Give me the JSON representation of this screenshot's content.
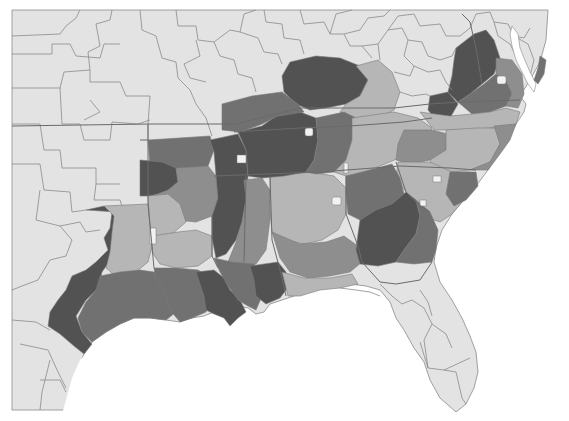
{
  "map": {
    "type": "choropleth",
    "region": "Southeastern United States",
    "projection_hint": "Albers-like, conterminous US south-east portion",
    "has_title": false,
    "has_legend": false,
    "has_labels": false,
    "colors": {
      "page_background": "#ffffff",
      "water": "#ffffff",
      "land_no_data": "#e3e3e3",
      "boundary_line": "#8a8a8a",
      "class_1_lightest": "#b6b6b6",
      "class_2_medium": "#8e8e8e",
      "class_3_medium_dark": "#717171",
      "class_4_darkest": "#525252",
      "holes_light": "#f2f2f2"
    },
    "classes": [
      {
        "id": 1,
        "shade": "lightest",
        "color": "#b6b6b6"
      },
      {
        "id": 2,
        "shade": "medium",
        "color": "#8e8e8e"
      },
      {
        "id": 3,
        "shade": "medium-dark",
        "color": "#717171"
      },
      {
        "id": 4,
        "shade": "darkest",
        "color": "#525252"
      }
    ],
    "shaded_regions": [
      {
        "name": "east-texas",
        "class": 4
      },
      {
        "name": "east-texas-interior",
        "class": 1
      },
      {
        "name": "texas-gulf-coast",
        "class": 3
      },
      {
        "name": "arkansas-north",
        "class": 3
      },
      {
        "name": "arkansas-west",
        "class": 4
      },
      {
        "name": "arkansas-delta",
        "class": 2
      },
      {
        "name": "louisiana-north",
        "class": 1
      },
      {
        "name": "louisiana-south",
        "class": 3
      },
      {
        "name": "louisiana-delta",
        "class": 4
      },
      {
        "name": "mississippi-delta",
        "class": 4
      },
      {
        "name": "mississippi-east",
        "class": 2
      },
      {
        "name": "mississippi-gulf",
        "class": 4
      },
      {
        "name": "west-tennessee",
        "class": 4
      },
      {
        "name": "kentucky-west",
        "class": 4
      },
      {
        "name": "kentucky-north-central",
        "class": 4
      },
      {
        "name": "kentucky-east",
        "class": 1
      },
      {
        "name": "middle-tennessee",
        "class": 3
      },
      {
        "name": "east-tennessee",
        "class": 1
      },
      {
        "name": "alabama-north",
        "class": 1
      },
      {
        "name": "alabama-central",
        "class": 2
      },
      {
        "name": "alabama-south",
        "class": 1
      },
      {
        "name": "georgia-central",
        "class": 4
      },
      {
        "name": "georgia-north",
        "class": 3
      },
      {
        "name": "georgia-east",
        "class": 3
      },
      {
        "name": "south-carolina",
        "class": 1
      },
      {
        "name": "south-carolina-coastal",
        "class": 3
      },
      {
        "name": "north-carolina-west",
        "class": 2
      },
      {
        "name": "north-carolina-piedmont",
        "class": 1
      },
      {
        "name": "north-carolina-east",
        "class": 2
      },
      {
        "name": "virginia-shenandoah",
        "class": 4
      },
      {
        "name": "virginia-central",
        "class": 3
      },
      {
        "name": "virginia-east",
        "class": 2
      },
      {
        "name": "southwest-virginia",
        "class": 4
      }
    ],
    "unshaded_regions": [
      "Oklahoma",
      "Kansas",
      "Missouri",
      "Illinois",
      "Indiana",
      "Ohio",
      "West Virginia",
      "Pennsylvania",
      "Maryland",
      "Delaware",
      "Florida",
      "West Texas"
    ]
  }
}
